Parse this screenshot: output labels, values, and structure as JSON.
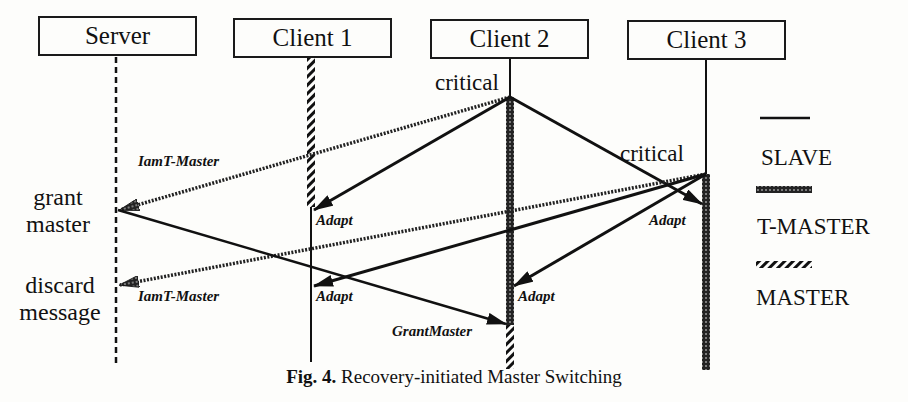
{
  "figure": {
    "caption_prefix": "Fig. 4.",
    "caption_text": "Recovery-initiated Master Switching"
  },
  "participants": [
    {
      "name": "Server",
      "lifeline_x": 116
    },
    {
      "name": "Client 1",
      "lifeline_x": 311
    },
    {
      "name": "Client 2",
      "lifeline_x": 510
    },
    {
      "name": "Client 3",
      "lifeline_x": 706
    }
  ],
  "events": {
    "client2_critical": "critical",
    "client3_critical": "critical",
    "server_grant_line1": "grant",
    "server_grant_line2": "master",
    "server_discard_line1": "discard",
    "server_discard_line2": "message"
  },
  "messages": [
    {
      "id": "m1",
      "from": "Client 2",
      "to": "Server",
      "label": "IamT-Master",
      "style": "wavy"
    },
    {
      "id": "m2",
      "from": "Client 2",
      "to": "Client 1",
      "label": "Adapt",
      "style": "solid"
    },
    {
      "id": "m3",
      "from": "Client 2",
      "to": "Client 3",
      "label": "Adapt",
      "style": "solid"
    },
    {
      "id": "m4",
      "from": "Client 3",
      "to": "Server",
      "label": "IamT-Master",
      "style": "wavy"
    },
    {
      "id": "m5",
      "from": "Client 3",
      "to": "Client 1",
      "label": "Adapt",
      "style": "solid"
    },
    {
      "id": "m6",
      "from": "Client 3",
      "to": "Client 2",
      "label": "Adapt",
      "style": "solid"
    },
    {
      "id": "m7",
      "from": "Server",
      "to": "Client 2",
      "label": "GrantMaster",
      "style": "solid"
    }
  ],
  "legend": [
    {
      "label": "SLAVE",
      "style": "solid"
    },
    {
      "label": "T-MASTER",
      "style": "dotted-thick"
    },
    {
      "label": "MASTER",
      "style": "hatched"
    }
  ]
}
